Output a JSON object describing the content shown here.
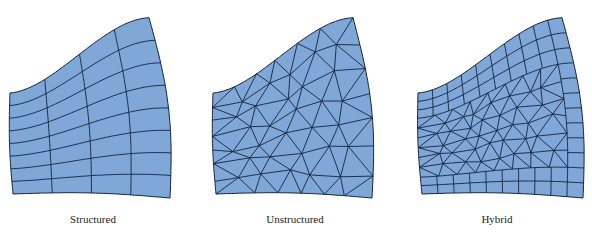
{
  "figure": {
    "colors": {
      "fill": "#7fa7d8",
      "line": "#16243a",
      "background": "#ffffff"
    },
    "panels": [
      {
        "id": "structured",
        "label": "Structured",
        "offset_x": 0,
        "mesh_type": "structured",
        "corners": {
          "tl": [
            10,
            93
          ],
          "tr": [
            149,
            17
          ],
          "br": [
            170,
            198
          ],
          "bl": [
            13,
            194
          ]
        },
        "grid": {
          "cols": 4,
          "rows": 8
        }
      },
      {
        "id": "unstructured",
        "label": "Unstructured",
        "offset_x": 200,
        "mesh_type": "unstructured",
        "corners": {
          "tl": [
            13,
            93
          ],
          "tr": [
            153,
            17
          ],
          "br": [
            172,
            198
          ],
          "bl": [
            16,
            194
          ]
        }
      },
      {
        "id": "hybrid",
        "label": "Hybrid",
        "offset_x": 392,
        "mesh_type": "hybrid",
        "corners": {
          "tl": [
            26,
            93
          ],
          "tr": [
            170,
            17
          ],
          "br": [
            191,
            198
          ],
          "bl": [
            30,
            194
          ]
        },
        "grid": {
          "cols": 10,
          "rows": 12,
          "quad_rows_top": 3,
          "quad_rows_bottom": 2,
          "quad_cols_right": 1
        }
      }
    ]
  }
}
